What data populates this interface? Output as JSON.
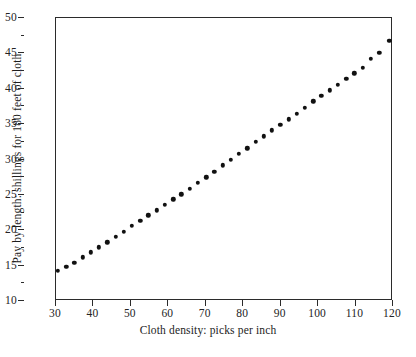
{
  "chart_data": {
    "type": "scatter",
    "title": "",
    "xlabel": "Cloth density: picks per inch",
    "ylabel": "Pay by length: shillings for 180 feet of cloth",
    "xlim": [
      30,
      120
    ],
    "ylim": [
      10,
      50
    ],
    "xticks": [
      30,
      40,
      50,
      60,
      70,
      80,
      90,
      100,
      110,
      120
    ],
    "yticks": [
      10,
      15,
      20,
      25,
      30,
      35,
      40,
      45,
      50
    ],
    "y_minor_ticks": [
      12.5,
      17.5,
      22.5,
      27.5,
      32.5,
      37.5,
      42.5,
      47.5
    ],
    "grid": false,
    "legend": false,
    "marker": "filled-circle",
    "marker_color": "#111111",
    "frame_color": "#2b2b2b",
    "background": "#ffffff",
    "x": [
      30.5,
      32.7,
      34.9,
      37.1,
      39.3,
      41.5,
      43.7,
      45.9,
      48.1,
      50.3,
      52.5,
      54.7,
      56.9,
      59.1,
      61.3,
      63.5,
      65.7,
      67.9,
      70.1,
      72.3,
      74.5,
      76.7,
      78.9,
      81.1,
      83.3,
      85.5,
      87.7,
      89.9,
      92.1,
      94.3,
      96.5,
      98.7,
      100.9,
      103.1,
      105.3,
      107.5,
      109.7,
      111.9,
      114.1,
      116.3,
      119.0
    ],
    "y": [
      14.3,
      14.8,
      15.4,
      16.2,
      16.9,
      17.6,
      18.3,
      19.1,
      19.8,
      20.6,
      21.3,
      22.1,
      22.8,
      23.6,
      24.4,
      25.1,
      25.9,
      26.7,
      27.5,
      28.3,
      29.2,
      30.0,
      30.8,
      31.6,
      32.5,
      33.3,
      34.1,
      34.9,
      35.7,
      36.5,
      37.3,
      38.2,
      39.0,
      39.8,
      40.6,
      41.4,
      42.2,
      43.0,
      44.2,
      45.1,
      46.8
    ],
    "n_points": 41,
    "x_unit": "picks per inch",
    "y_unit": "shillings per 180 feet"
  }
}
